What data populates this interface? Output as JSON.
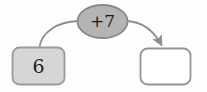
{
  "diagram": {
    "type": "function-machine",
    "background_color": "#fdfdfd",
    "input": {
      "value": "6",
      "fill_color": "#d6d6d6",
      "border_color": "#9a9a9a"
    },
    "operation": {
      "label": "+7",
      "fill_color": "#b4b4b4",
      "border_color": "#8a8a8a"
    },
    "output": {
      "value": "",
      "fill_color": "#ffffff",
      "border_color": "#949494"
    },
    "connectors": {
      "stroke_color": "#8d8d8d",
      "arrowhead_color": "#8d8d8d",
      "in_arrow_label": "",
      "out_arrow_label": ""
    }
  }
}
